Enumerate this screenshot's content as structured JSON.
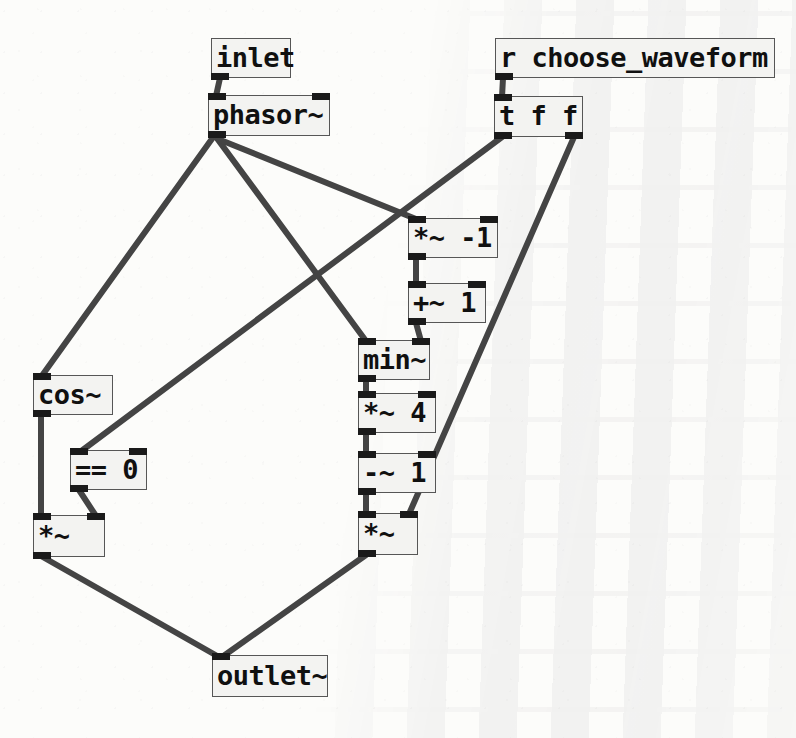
{
  "patch": {
    "title": "pd waveform subpatch",
    "background_color": "#fcfcfa",
    "box_fill_color": "#f3f3f1",
    "box_border_color": "#565656",
    "wire_color": "#444444",
    "port_color": "#1a1a1a"
  },
  "objects": [
    {
      "id": "inlet",
      "label": "inlet",
      "x": 211,
      "y": 38,
      "w": 80,
      "h": 40,
      "inlets": 0,
      "outlets": 1,
      "type": "inlet"
    },
    {
      "id": "phasor",
      "label": "phasor~",
      "x": 208,
      "y": 95,
      "w": 122,
      "h": 41,
      "inlets": 2,
      "outlets": 1,
      "type": "object"
    },
    {
      "id": "recv",
      "label": "r choose_waveform",
      "x": 495,
      "y": 38,
      "w": 280,
      "h": 40,
      "inlets": 0,
      "outlets": 1,
      "type": "object"
    },
    {
      "id": "trigger",
      "label": "t f f",
      "x": 494,
      "y": 96,
      "w": 89,
      "h": 41,
      "inlets": 1,
      "outlets": 2,
      "type": "object"
    },
    {
      "id": "mul_neg1",
      "label": "*~ -1",
      "x": 408,
      "y": 218,
      "w": 90,
      "h": 40,
      "inlets": 2,
      "outlets": 1,
      "type": "object"
    },
    {
      "id": "add_1",
      "label": "+~ 1",
      "x": 408,
      "y": 283,
      "w": 78,
      "h": 40,
      "inlets": 2,
      "outlets": 1,
      "type": "object"
    },
    {
      "id": "min",
      "label": "min~",
      "x": 358,
      "y": 340,
      "w": 72,
      "h": 40,
      "inlets": 2,
      "outlets": 1,
      "type": "object"
    },
    {
      "id": "mul_4",
      "label": "*~ 4",
      "x": 358,
      "y": 393,
      "w": 78,
      "h": 40,
      "inlets": 2,
      "outlets": 1,
      "type": "object"
    },
    {
      "id": "sub_1",
      "label": "-~ 1",
      "x": 358,
      "y": 453,
      "w": 78,
      "h": 40,
      "inlets": 2,
      "outlets": 1,
      "type": "object"
    },
    {
      "id": "mul_right",
      "label": "*~",
      "x": 358,
      "y": 513,
      "w": 60,
      "h": 42,
      "inlets": 2,
      "outlets": 1,
      "type": "object"
    },
    {
      "id": "cos",
      "label": "cos~",
      "x": 33,
      "y": 375,
      "w": 80,
      "h": 40,
      "inlets": 1,
      "outlets": 1,
      "type": "object"
    },
    {
      "id": "eq_0",
      "label": "== 0",
      "x": 70,
      "y": 450,
      "w": 77,
      "h": 40,
      "inlets": 2,
      "outlets": 1,
      "type": "object"
    },
    {
      "id": "mul_left",
      "label": "*~",
      "x": 33,
      "y": 515,
      "w": 72,
      "h": 42,
      "inlets": 2,
      "outlets": 1,
      "type": "object"
    },
    {
      "id": "outlet",
      "label": "outlet~",
      "x": 212,
      "y": 655,
      "w": 116,
      "h": 42,
      "inlets": 1,
      "outlets": 0,
      "type": "outlet"
    }
  ],
  "connections": [
    {
      "from": "inlet",
      "from_outlet": 0,
      "to": "phasor",
      "to_inlet": 0,
      "x1": 220,
      "y1": 78,
      "x2": 216,
      "y2": 96
    },
    {
      "from": "phasor",
      "from_outlet": 0,
      "to": "cos",
      "to_inlet": 0,
      "x1": 214,
      "y1": 136,
      "x2": 41,
      "y2": 377
    },
    {
      "from": "phasor",
      "from_outlet": 0,
      "to": "min",
      "to_inlet": 0,
      "x1": 216,
      "y1": 137,
      "x2": 366,
      "y2": 341
    },
    {
      "from": "phasor",
      "from_outlet": 0,
      "to": "mul_neg1",
      "to_inlet": 0,
      "x1": 218,
      "y1": 139,
      "x2": 416,
      "y2": 219
    },
    {
      "from": "recv",
      "from_outlet": 0,
      "to": "trigger",
      "to_inlet": 0,
      "x1": 503,
      "y1": 78,
      "x2": 502,
      "y2": 97
    },
    {
      "from": "trigger",
      "from_outlet": 0,
      "to": "eq_0",
      "to_inlet": 0,
      "x1": 502,
      "y1": 137,
      "x2": 80,
      "y2": 452
    },
    {
      "from": "trigger",
      "from_outlet": 1,
      "to": "mul_right",
      "to_inlet": 1,
      "x1": 574,
      "y1": 137,
      "x2": 409,
      "y2": 514
    },
    {
      "from": "mul_neg1",
      "from_outlet": 0,
      "to": "add_1",
      "to_inlet": 0,
      "x1": 416,
      "y1": 258,
      "x2": 416,
      "y2": 284
    },
    {
      "from": "add_1",
      "from_outlet": 0,
      "to": "min",
      "to_inlet": 1,
      "x1": 416,
      "y1": 323,
      "x2": 421,
      "y2": 341
    },
    {
      "from": "min",
      "from_outlet": 0,
      "to": "mul_4",
      "to_inlet": 0,
      "x1": 366,
      "y1": 380,
      "x2": 366,
      "y2": 394
    },
    {
      "from": "mul_4",
      "from_outlet": 0,
      "to": "sub_1",
      "to_inlet": 0,
      "x1": 366,
      "y1": 433,
      "x2": 366,
      "y2": 454
    },
    {
      "from": "sub_1",
      "from_outlet": 0,
      "to": "mul_right",
      "to_inlet": 0,
      "x1": 366,
      "y1": 493,
      "x2": 366,
      "y2": 514
    },
    {
      "from": "cos",
      "from_outlet": 0,
      "to": "mul_left",
      "to_inlet": 0,
      "x1": 41,
      "y1": 415,
      "x2": 41,
      "y2": 516
    },
    {
      "from": "eq_0",
      "from_outlet": 0,
      "to": "mul_left",
      "to_inlet": 1,
      "x1": 79,
      "y1": 490,
      "x2": 96,
      "y2": 516
    },
    {
      "from": "mul_left",
      "from_outlet": 0,
      "to": "outlet",
      "to_inlet": 0,
      "x1": 41,
      "y1": 556,
      "x2": 219,
      "y2": 657
    },
    {
      "from": "mul_right",
      "from_outlet": 0,
      "to": "outlet",
      "to_inlet": 0,
      "x1": 366,
      "y1": 555,
      "x2": 222,
      "y2": 657
    }
  ]
}
